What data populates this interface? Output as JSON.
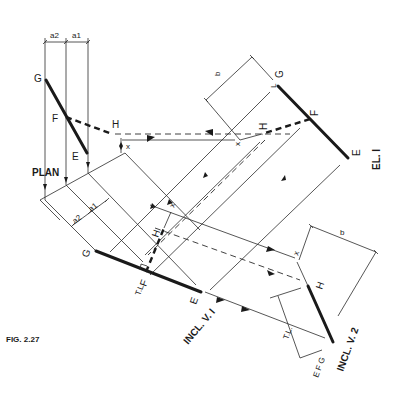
{
  "figure": {
    "caption": "FIG. 2.27",
    "views": {
      "plan": "PLAN",
      "el1": "EL. I",
      "incl_v1": "INCL. V. I",
      "incl_v2": "INCL. V. 2"
    },
    "dimensions": {
      "a1": "a1",
      "a2": "a2",
      "b": "b"
    },
    "points": {
      "E": "E",
      "F": "F",
      "G": "G",
      "H": "H",
      "x": "x",
      "TL": "T.L.",
      "EFG": "E F G"
    }
  },
  "colors": {
    "line": "#1a1a1a",
    "background": "#ffffff"
  }
}
